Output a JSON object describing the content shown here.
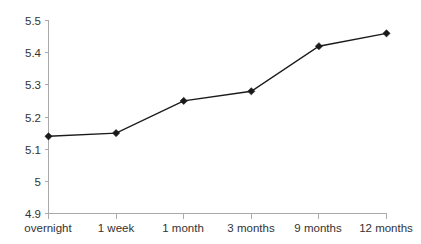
{
  "chart_data": {
    "type": "line",
    "title": "",
    "subtitle": "",
    "xlabel": "",
    "ylabel": "",
    "categories": [
      "overnight",
      "1 week",
      "1 month",
      "3 months",
      "9 months",
      "12 months"
    ],
    "values": [
      5.14,
      5.15,
      5.25,
      5.28,
      5.42,
      5.46
    ],
    "series": [
      {
        "name": "",
        "values": [
          5.14,
          5.15,
          5.25,
          5.28,
          5.42,
          5.46
        ]
      }
    ],
    "ylim": [
      4.9,
      5.5
    ],
    "yticks": [
      4.9,
      5.0,
      5.1,
      5.2,
      5.3,
      5.4,
      5.5
    ],
    "ytick_labels": [
      "4.9",
      "5",
      "5.1",
      "5.2",
      "5.3",
      "5.4",
      "5.5"
    ],
    "grid": false,
    "legend": "none",
    "marker": "diamond",
    "line_color": "#1a1a1a",
    "axis_color": "#aaaaaa",
    "text_color": "#333333",
    "background": "#ffffff"
  },
  "axes": {
    "y_ticks": [
      {
        "label": "5.5",
        "value": 5.5
      },
      {
        "label": "5.4",
        "value": 5.4
      },
      {
        "label": "5.3",
        "value": 5.3
      },
      {
        "label": "5.2",
        "value": 5.2
      },
      {
        "label": "5.1",
        "value": 5.1
      },
      {
        "label": "5",
        "value": 5.0
      },
      {
        "label": "4.9",
        "value": 4.9
      }
    ],
    "x_ticks": [
      {
        "label": "overnight"
      },
      {
        "label": "1 week"
      },
      {
        "label": "1 month"
      },
      {
        "label": "3 months"
      },
      {
        "label": "9 months"
      },
      {
        "label": "12 months"
      }
    ]
  }
}
